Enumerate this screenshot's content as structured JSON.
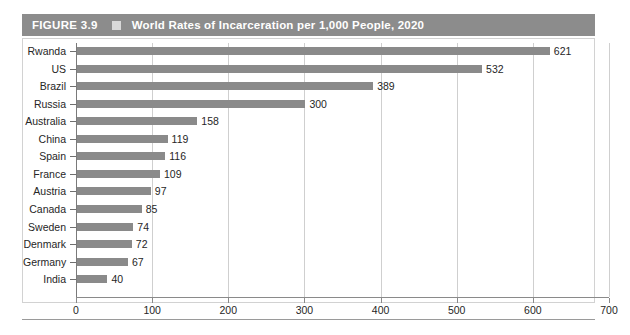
{
  "figure": {
    "number_label": "FIGURE 3.9",
    "separator_icon": "square-bullet-icon",
    "title": "World Rates of Incarceration per 1,000 People, 2020",
    "header_bg": "#8c8c8c",
    "header_text_color": "#ffffff",
    "bar_color": "#8a8a8a",
    "grid_color": "#cfcfcf",
    "axis_color": "#8a8a8a",
    "border_color": "#d2d2d2"
  },
  "chart_data": {
    "type": "bar",
    "orientation": "horizontal",
    "title": "World Rates of Incarceration per 1,000 People, 2020",
    "subtitle": "",
    "xlabel": "",
    "ylabel": "",
    "xlim": [
      0,
      700
    ],
    "xticks": [
      0,
      100,
      200,
      300,
      400,
      500,
      600,
      700
    ],
    "xtick_labels": [
      "0",
      "100",
      "200",
      "300",
      "400",
      "500",
      "600",
      "700"
    ],
    "grid": true,
    "grid_axis": "x",
    "legend": false,
    "data_labels": true,
    "categories": [
      "Rwanda",
      "US",
      "Brazil",
      "Russia",
      "Australia",
      "China",
      "Spain",
      "France",
      "Austria",
      "Canada",
      "Sweden",
      "Denmark",
      "Germany",
      "India"
    ],
    "values": [
      621,
      532,
      389,
      300,
      158,
      119,
      116,
      109,
      97,
      85,
      74,
      72,
      67,
      40
    ],
    "value_labels": [
      "621",
      "532",
      "389",
      "300",
      "158",
      "119",
      "116",
      "109",
      "97",
      "85",
      "74",
      "72",
      "67",
      "40"
    ],
    "series": [
      {
        "name": "Incarceration rate per 1,000 people (2020)",
        "values": [
          621,
          532,
          389,
          300,
          158,
          119,
          116,
          109,
          97,
          85,
          74,
          72,
          67,
          40
        ]
      }
    ]
  }
}
